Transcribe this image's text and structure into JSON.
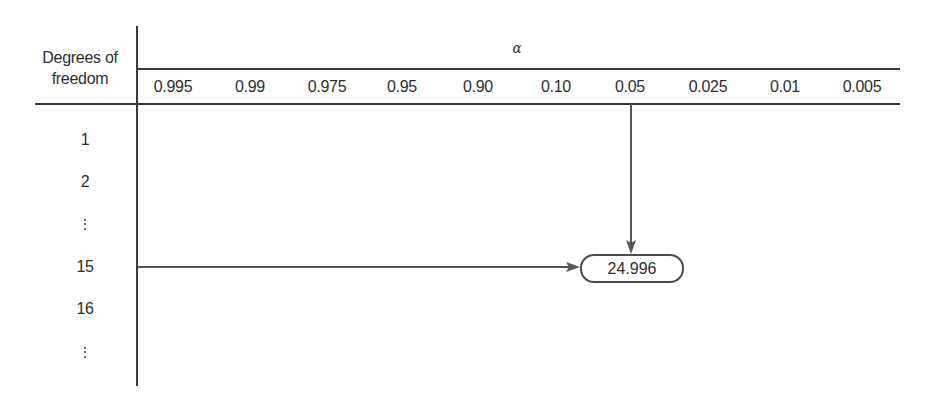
{
  "header": {
    "row_header_line1": "Degrees of",
    "row_header_line2": "freedom",
    "column_group_label": "α"
  },
  "alpha_columns": [
    "0.995",
    "0.99",
    "0.975",
    "0.95",
    "0.90",
    "0.10",
    "0.05",
    "0.025",
    "0.01",
    "0.005"
  ],
  "rows": [
    {
      "label": "1"
    },
    {
      "label": "2"
    },
    {
      "label": "⋮"
    },
    {
      "label": "15"
    },
    {
      "label": "16"
    },
    {
      "label": "⋮"
    }
  ],
  "lookup": {
    "selected_df": "15",
    "selected_alpha": "0.05",
    "result_value": "24.996"
  },
  "colors": {
    "line": "#3a3a3a",
    "text": "#2e2e2e",
    "arrow": "#555555"
  }
}
